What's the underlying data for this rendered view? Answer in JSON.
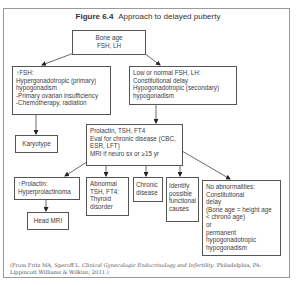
{
  "figure": {
    "label": "Figure 6.4",
    "title": "Approach to delayed puberty"
  },
  "nodes": {
    "root": {
      "lines": [
        "Bone age",
        "FSH, LH"
      ]
    },
    "high_fsh": {
      "lines": [
        "↑FSH:",
        "Hypergonadotropic (primary)",
        "hypogonadism",
        "-Primary ovarian insufficiency",
        "-Chemotherapy, radiation"
      ]
    },
    "low_fsh": {
      "lines": [
        "Low or normal FSH, LH:",
        "Constitutional delay",
        "Hypogonadotropic (secondary)",
        "hypogonadism"
      ]
    },
    "karyotype": {
      "lines": [
        "Karyotype"
      ]
    },
    "prolactin_eval": {
      "lines": [
        "Prolactin, TSH, FT4",
        "Eval for chronic disease (CBC,",
        "ESR, LFT)",
        "MRI if neuro sx or ≥15 yr"
      ]
    },
    "high_prolactin": {
      "lines": [
        "↑Prolactin:",
        "Hyperprolactinoma"
      ]
    },
    "head_mri": {
      "lines": [
        "Head MRI"
      ]
    },
    "abnormal_tsh": {
      "lines": [
        "Abnormal",
        "TSH, FT4:",
        "Thyroid",
        "disorder"
      ]
    },
    "chronic_disease": {
      "lines": [
        "Chronic",
        "disease"
      ]
    },
    "functional": {
      "lines": [
        "Identify",
        "possible",
        "functional",
        "causes"
      ]
    },
    "no_abnormalities": {
      "lines": [
        "No abnormalities:",
        "Constitutional",
        "delay",
        "(Bone age = height age",
        "< chrono age)",
        "or",
        "permanent",
        "hypogonadotropic",
        "hypogonadism"
      ]
    }
  },
  "citation": {
    "prefix": "(From Fritz MA, Speroff L. ",
    "book": "Clinical Gynecologic Endocrinology and Infertility",
    "suffix": ". Philadelphia, PA: Lippincott Williams & Wilkins; 2011.)"
  },
  "colors": {
    "frame": "#9a9a9a",
    "box_border": "#555555",
    "text": "#3d3d3d"
  }
}
